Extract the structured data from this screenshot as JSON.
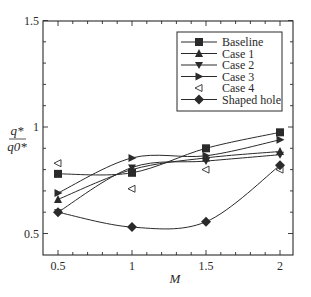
{
  "chart_data": {
    "type": "line",
    "title": "",
    "xlabel": "M",
    "ylabel": {
      "numerator": "q*",
      "denominator": "q0*"
    },
    "xlim": [
      0.4,
      2.1
    ],
    "ylim": [
      0.4,
      1.5
    ],
    "x_ticks": [
      0.5,
      1,
      1.5,
      2
    ],
    "x_tick_labels": [
      "0.5",
      "1",
      "1.5",
      "2"
    ],
    "y_ticks": [
      0.5,
      1,
      1.5
    ],
    "y_tick_labels": [
      "0.5",
      "1",
      "1.5"
    ],
    "grid": false,
    "legend_position": "upper right",
    "x": [
      0.5,
      1,
      1.5,
      2
    ],
    "series": [
      {
        "name": "Baseline",
        "marker": "square-filled",
        "line": true,
        "values": [
          0.78,
          0.785,
          0.9,
          0.975
        ]
      },
      {
        "name": "Case 1",
        "marker": "triangle-up-filled",
        "line": true,
        "values": [
          0.66,
          0.8,
          0.855,
          0.885
        ]
      },
      {
        "name": "Case 2",
        "marker": "triangle-down-filled",
        "line": true,
        "values": [
          0.6,
          0.81,
          0.84,
          0.87
        ]
      },
      {
        "name": "Case 3",
        "marker": "triangle-right-filled",
        "line": true,
        "values": [
          0.69,
          0.855,
          0.865,
          0.94
        ]
      },
      {
        "name": "Case 4",
        "marker": "triangle-left-open",
        "line": false,
        "values": [
          0.83,
          0.71,
          0.8,
          0.8
        ]
      },
      {
        "name": "Shaped hole",
        "marker": "diamond-filled",
        "line": true,
        "values": [
          0.6,
          0.53,
          0.555,
          0.82
        ]
      }
    ]
  },
  "colors": {
    "ink": "#2a2a2a",
    "background": "#ffffff"
  }
}
